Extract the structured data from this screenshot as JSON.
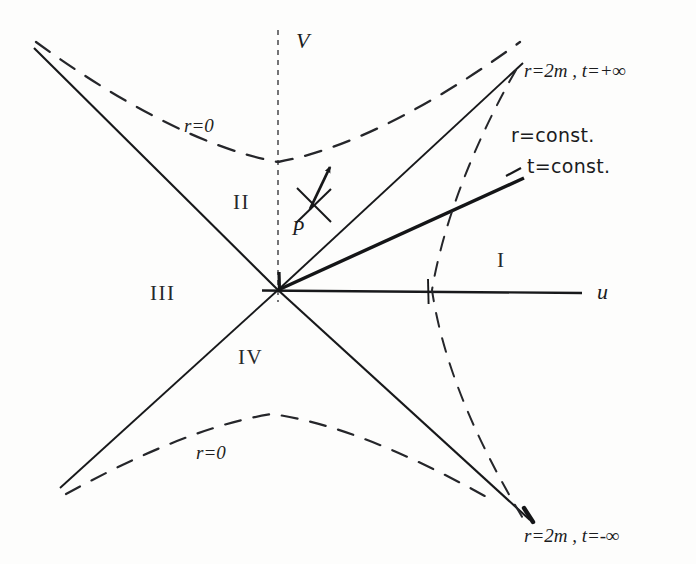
{
  "figure": {
    "type": "kruskal-szekeres-diagram",
    "background_color": "#fdfdfc",
    "ink_color": "#1b1c1e"
  },
  "axes": {
    "vertical": {
      "label": "V",
      "style": "dashed",
      "x": 278,
      "top_y": 30,
      "bottom_y": 300,
      "label_x": 296,
      "label_y": 30
    },
    "horizontal": {
      "label": "u",
      "style": "solid",
      "y": 290,
      "left_x": 262,
      "right_x": 582,
      "label_x": 597,
      "label_y": 281,
      "tick_x": 428
    },
    "origin": {
      "x": 278,
      "y": 290
    }
  },
  "regions": [
    {
      "name": "region-i",
      "label": "I",
      "x": 497,
      "y": 250
    },
    {
      "name": "region-ii",
      "label": "II",
      "x": 233,
      "y": 192
    },
    {
      "name": "region-iii",
      "label": "III",
      "x": 150,
      "y": 283
    },
    {
      "name": "region-iv",
      "label": "IV",
      "x": 238,
      "y": 347
    }
  ],
  "horizon_labels": [
    {
      "name": "horizon-future",
      "text": "r=2m , t=+∞",
      "x": 524,
      "y": 61
    },
    {
      "name": "horizon-past",
      "text": "r=2m , t=-∞",
      "x": 524,
      "y": 526
    }
  ],
  "curve_labels": [
    {
      "name": "r-const-label",
      "text": "r=const.",
      "x": 511,
      "y": 126
    },
    {
      "name": "t-const-label",
      "text": "t=const.",
      "x": 527,
      "y": 157
    },
    {
      "name": "r-zero-upper",
      "text": "r=0",
      "x": 184,
      "y": 116
    },
    {
      "name": "r-zero-lower",
      "text": "r=0",
      "x": 196,
      "y": 443
    }
  ],
  "point_p": {
    "label": "P",
    "label_x": 292,
    "label_y": 218,
    "center_x": 313,
    "center_y": 205,
    "arrow_tip_x": 331,
    "arrow_tip_y": 161
  },
  "singularity_curves": {
    "upper": {
      "name": "r-equals-zero-upper",
      "vertex_x": 278,
      "vertex_y": 162,
      "style": "dashed"
    },
    "lower": {
      "name": "r-equals-zero-lower",
      "vertex_x": 272,
      "vertex_y": 414,
      "style": "dashed"
    }
  },
  "r_const_curve": {
    "name": "r-const-hyperbola",
    "vertex_x": 432,
    "vertex_y": 290,
    "style": "dashed"
  },
  "t_const_line": {
    "name": "t-const-ray",
    "from_x": 278,
    "from_y": 290,
    "to_x": 524,
    "to_y": 178
  },
  "light_cone_lines": [
    {
      "name": "horizon-line-up-right",
      "x1": 278,
      "y1": 290,
      "x2": 523,
      "y2": 63
    },
    {
      "name": "horizon-line-up-left",
      "x1": 278,
      "y1": 290,
      "x2": 34,
      "y2": 48
    },
    {
      "name": "horizon-line-down-right",
      "x1": 278,
      "y1": 290,
      "x2": 530,
      "y2": 520
    },
    {
      "name": "horizon-line-down-left",
      "x1": 278,
      "y1": 290,
      "x2": 60,
      "y2": 488
    }
  ]
}
